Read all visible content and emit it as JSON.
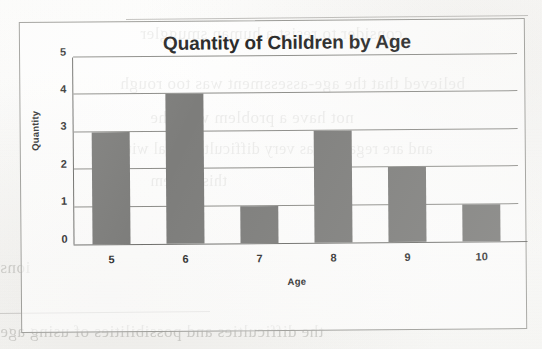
{
  "page": {
    "background_color": "#fbfbfa",
    "scan_artifact_note": "scanned book page with reverse-side bleed-through"
  },
  "chart_frame": {
    "border_color": "#9a9a96"
  },
  "bleed_through_text": [
    {
      "text": "consider to resist a human smuggler",
      "left": 140,
      "top": 24,
      "size": 17
    },
    {
      "text": "believed that the age-assessment was too rough",
      "left": 120,
      "top": 74,
      "size": 17
    },
    {
      "text": "not have a problem with the",
      "left": 150,
      "top": 108,
      "size": 17
    },
    {
      "text": "and are regarded as very difficult to deal with",
      "left": 118,
      "top": 140,
      "size": 16
    },
    {
      "text": "this system",
      "left": 150,
      "top": 172,
      "size": 16
    },
    {
      "text": "ions",
      "left": 0,
      "top": 258,
      "size": 17
    },
    {
      "text": "the difficulties and possibilities of using age",
      "left": 0,
      "top": 322,
      "size": 17
    }
  ],
  "chart_data": {
    "type": "bar",
    "title": "Quantity of Children by Age",
    "xlabel": "Age",
    "ylabel": "Quantity",
    "categories": [
      "5",
      "6",
      "7",
      "8",
      "9",
      "10"
    ],
    "values": [
      3,
      4,
      1,
      3,
      2,
      1
    ],
    "ylim": [
      0,
      5
    ],
    "yticks": [
      0,
      1,
      2,
      3,
      4,
      5
    ],
    "grid": true,
    "legend": "none",
    "bar_color": "#7d7d7b",
    "gridline_color": "#8d8d89",
    "series": [
      {
        "name": "Quantity",
        "values": [
          3,
          4,
          1,
          3,
          2,
          1
        ]
      }
    ]
  }
}
